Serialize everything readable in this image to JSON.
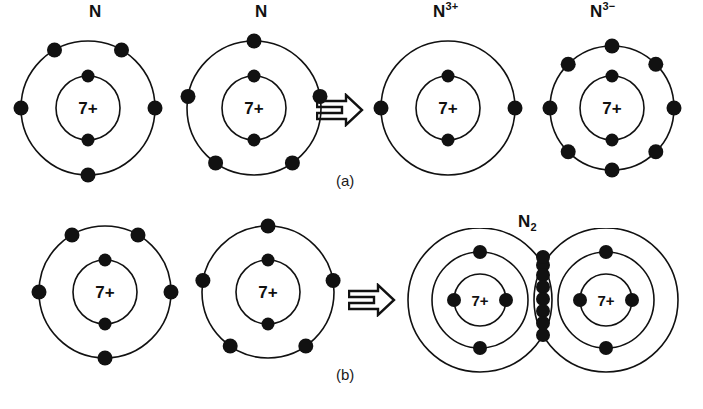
{
  "figure": {
    "background_color": "#ffffff",
    "stroke_color": "#111111",
    "electron_color": "#111111",
    "width": 703,
    "height": 409
  },
  "panels": [
    {
      "id": "a",
      "label": "(a)",
      "caption_x": 340,
      "caption_y": 176,
      "arrow": {
        "name": "double-arrow-right",
        "glyph": "⇒",
        "x": 318,
        "y": 95
      },
      "items": [
        {
          "name": "nitrogen-atom-1",
          "label": "N",
          "label_sup": "",
          "label_x": 93,
          "label_y": 4,
          "cx": 88,
          "cy": 110,
          "shells": [
            {
              "radius": 32,
              "electrons": 2,
              "angles": [
                90,
                270
              ]
            },
            {
              "radius": 67,
              "electrons": 5,
              "angles": [
                120,
                60,
                180,
                0,
                270
              ]
            }
          ],
          "nucleus_charge": "7+"
        },
        {
          "name": "nitrogen-atom-2",
          "label": "N",
          "label_sup": "",
          "label_x": 258,
          "label_y": 4,
          "cx": 254,
          "cy": 110,
          "shells": [
            {
              "radius": 32,
              "electrons": 2,
              "angles": [
                90,
                270
              ]
            },
            {
              "radius": 67,
              "electrons": 5,
              "angles": [
                90,
                170,
                10,
                235,
                305
              ]
            }
          ],
          "nucleus_charge": "7+"
        },
        {
          "name": "nitrogen-cation",
          "label": "N",
          "label_sup": "3+",
          "label_x": 437,
          "label_y": 4,
          "cx": 448,
          "cy": 110,
          "shells": [
            {
              "radius": 32,
              "electrons": 2,
              "angles": [
                90,
                270
              ]
            },
            {
              "radius": 67,
              "electrons": 2,
              "angles": [
                180,
                0
              ]
            }
          ],
          "nucleus_charge": "7+"
        },
        {
          "name": "nitrogen-anion",
          "label": "N",
          "label_sup": "3−",
          "label_x": 594,
          "label_y": 4,
          "cx": 607,
          "cy": 110,
          "shells": [
            {
              "radius": 32,
              "electrons": 2,
              "angles": [
                90,
                270
              ]
            },
            {
              "radius": 62,
              "electrons": 8,
              "angles": [
                90,
                45,
                0,
                315,
                270,
                225,
                180,
                135
              ]
            }
          ],
          "nucleus_charge": "7+"
        }
      ]
    },
    {
      "id": "b",
      "label": "(b)",
      "caption_x": 340,
      "caption_y": 372,
      "arrow": {
        "name": "double-arrow-right",
        "glyph": "⇒",
        "x": 350,
        "y": 283
      },
      "items": [
        {
          "name": "nitrogen-atom-3",
          "label": "",
          "label_sup": "",
          "label_x": 0,
          "label_y": 0,
          "cx": 105,
          "cy": 292,
          "shells": [
            {
              "radius": 32,
              "electrons": 2,
              "angles": [
                90,
                270
              ]
            },
            {
              "radius": 66,
              "electrons": 5,
              "angles": [
                120,
                60,
                180,
                0,
                270
              ]
            }
          ],
          "nucleus_charge": "7+"
        },
        {
          "name": "nitrogen-atom-4",
          "label": "",
          "label_sup": "",
          "label_x": 0,
          "label_y": 0,
          "cx": 268,
          "cy": 292,
          "shells": [
            {
              "radius": 32,
              "electrons": 2,
              "angles": [
                90,
                270
              ]
            },
            {
              "radius": 66,
              "electrons": 5,
              "angles": [
                90,
                170,
                10,
                235,
                305
              ]
            }
          ],
          "nucleus_charge": "7+"
        }
      ],
      "molecule": {
        "name": "nitrogen-molecule",
        "label": "N",
        "label_sub": "2",
        "label_x": 522,
        "label_y": 216,
        "left_center_x": 480,
        "right_center_x": 605,
        "center_y": 300,
        "outer_radius": 72,
        "middle_radius": 48,
        "inner_radius": 26,
        "left_atom": {
          "nucleus_charge": "7+",
          "inner_electrons_angles": [
            180,
            0
          ],
          "middle_electrons_angles": [
            90,
            270
          ]
        },
        "right_atom": {
          "nucleus_charge": "7+",
          "inner_electrons_angles": [
            180,
            0
          ],
          "middle_electrons_angles": [
            90,
            270
          ]
        },
        "shared_electrons_count": 6,
        "junction_electrons_count": 2
      }
    }
  ]
}
